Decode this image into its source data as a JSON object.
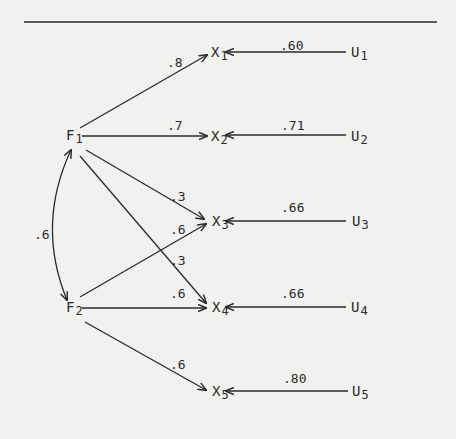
{
  "diagram": {
    "type": "path-diagram",
    "factors": [
      {
        "id": "F1",
        "letter": "F",
        "sub": "1"
      },
      {
        "id": "F2",
        "letter": "F",
        "sub": "2"
      }
    ],
    "observed": [
      {
        "id": "X1",
        "letter": "X",
        "sub": "1"
      },
      {
        "id": "X2",
        "letter": "X",
        "sub": "2"
      },
      {
        "id": "X3",
        "letter": "X",
        "sub": "3"
      },
      {
        "id": "X4",
        "letter": "X",
        "sub": "4"
      },
      {
        "id": "X5",
        "letter": "X",
        "sub": "5"
      }
    ],
    "unique": [
      {
        "id": "U1",
        "letter": "U",
        "sub": "1"
      },
      {
        "id": "U2",
        "letter": "U",
        "sub": "2"
      },
      {
        "id": "U3",
        "letter": "U",
        "sub": "3"
      },
      {
        "id": "U4",
        "letter": "U",
        "sub": "4"
      },
      {
        "id": "U5",
        "letter": "U",
        "sub": "5"
      }
    ],
    "loadings": {
      "F1_X1": ".8",
      "F1_X2": ".7",
      "F1_X3": ".3",
      "F2_X3": ".6",
      "F1_X4": ".3",
      "F2_X4": ".6",
      "F2_X5": ".6"
    },
    "uniqueness_paths": {
      "U1_X1": ".60",
      "U2_X2": ".71",
      "U3_X3": ".66",
      "U4_X4": ".66",
      "U5_X5": ".80"
    },
    "factor_correlation": {
      "F1_F2": ".6"
    }
  }
}
